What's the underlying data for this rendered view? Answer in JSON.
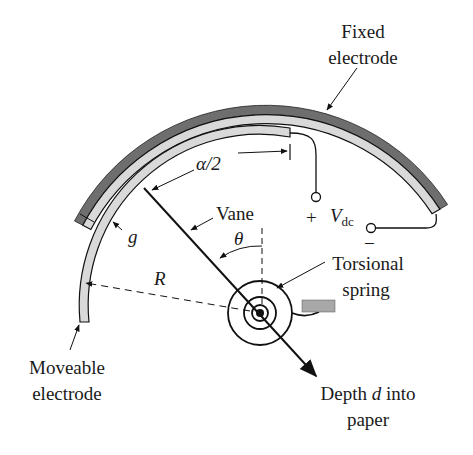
{
  "figure": {
    "type": "electrostatic vane actuator schematic",
    "colors": {
      "fixed_electrode_outer": "#6e6e6e",
      "electrode_inner": "#d9d9d9",
      "stroke": "#111111",
      "anchor": "#a8a8a8",
      "background": "#ffffff"
    }
  },
  "labels": {
    "fixed_electrode_line1": "Fixed",
    "fixed_electrode_line2": "electrode",
    "alpha_half": "α/2",
    "vane": "Vane",
    "theta": "θ",
    "plus": "+",
    "vdc_main": "V",
    "vdc_sub": "dc",
    "minus": "−",
    "gap": "g",
    "radius": "R",
    "torsional_line1": "Torsional",
    "torsional_line2": "spring",
    "moveable_line1": "Moveable",
    "moveable_line2": "electrode",
    "depth_line1_a": "Depth ",
    "depth_line1_d": "d",
    "depth_line1_b": " into",
    "depth_line2": "paper"
  }
}
